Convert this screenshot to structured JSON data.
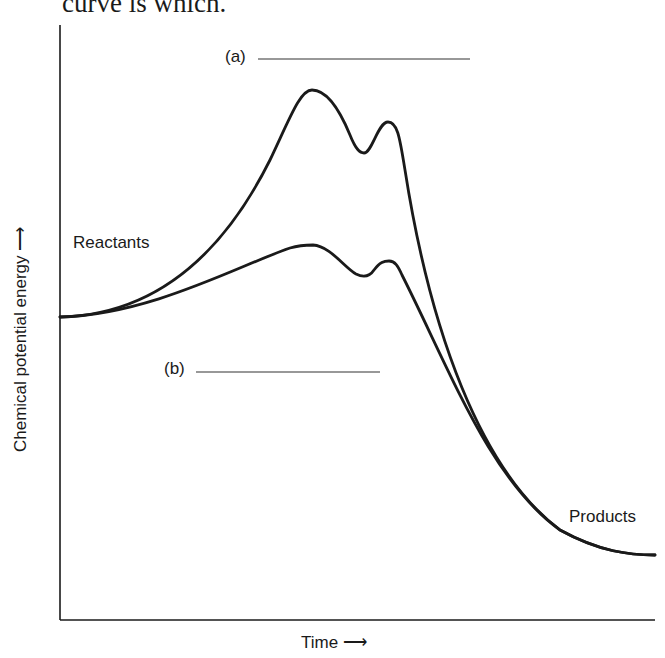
{
  "caption": {
    "text": "curve is which."
  },
  "axes": {
    "y_label": "Chemical potential energy",
    "y_arrow": "⟶",
    "x_label": "Time",
    "x_arrow": "⟶"
  },
  "labels": {
    "reactants": "Reactants",
    "products": "Products",
    "curve_a": "(a)",
    "curve_b": "(b)"
  },
  "colors": {
    "ink": "#1a1a1a",
    "background": "#ffffff"
  },
  "curves": [
    {
      "id": "a",
      "description": "Higher-energy path with two peaks (uncatalyzed)",
      "start": "Reactants",
      "end": "Products"
    },
    {
      "id": "b",
      "description": "Lower-energy path with two smaller peaks (catalyzed)",
      "start": "Reactants",
      "end": "Products"
    }
  ]
}
